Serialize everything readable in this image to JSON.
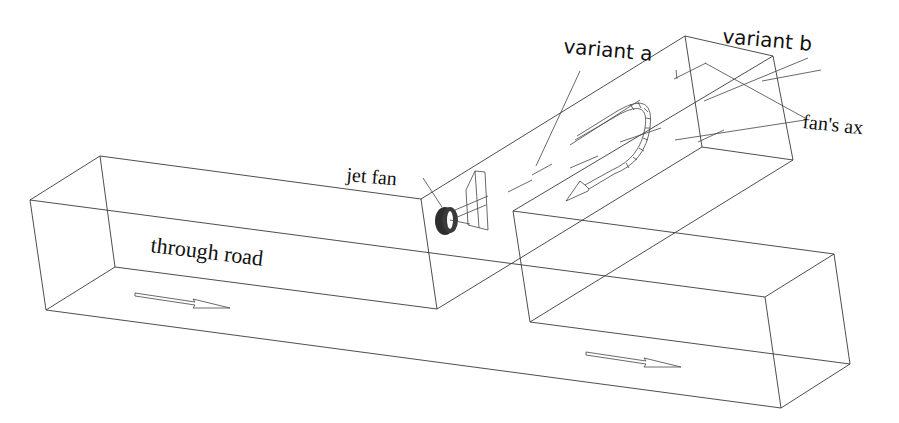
{
  "diagram": {
    "type": "3d-wireframe-tunnel-schematic",
    "labels": {
      "through_road": "through road",
      "jet_fan": "jet fan",
      "variant_a": "variant a",
      "variant_b": "variant b",
      "fans_ax": "fan's ax"
    },
    "elements": [
      {
        "name": "through-road-tunnel",
        "shape": "box",
        "flow_arrows": 2
      },
      {
        "name": "branch-tunnel",
        "shape": "inclined-box",
        "flow": "u-turn"
      },
      {
        "name": "jet-fan",
        "shape": "cylinder"
      }
    ],
    "colors": {
      "line": "#3a3a3a",
      "fan": "#2a2a2a",
      "background": "#ffffff"
    }
  }
}
